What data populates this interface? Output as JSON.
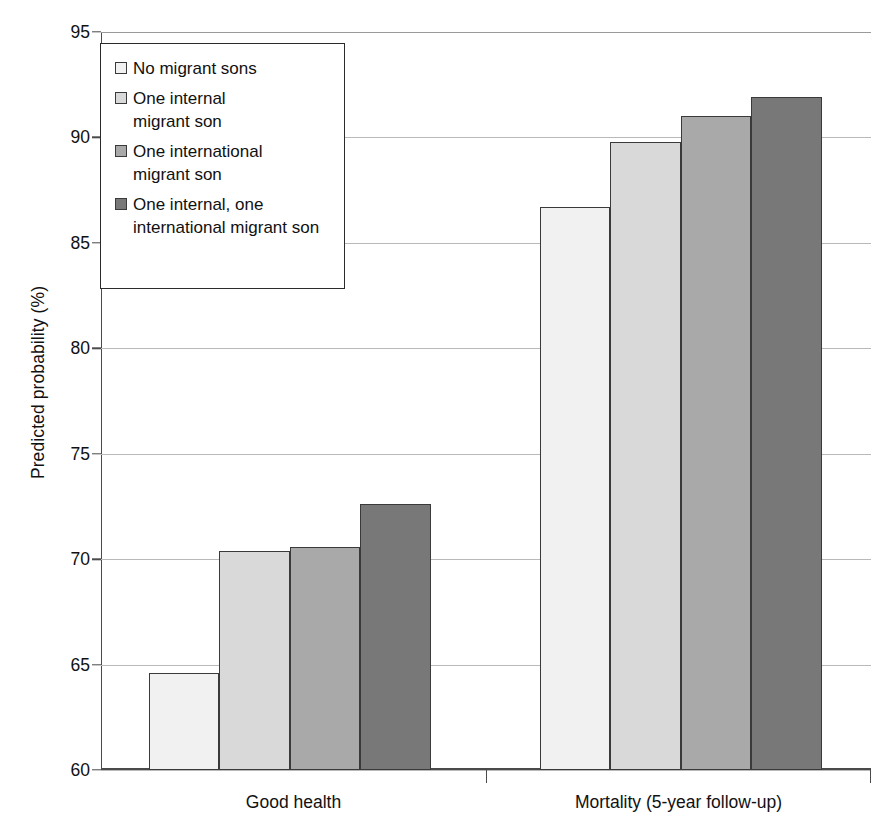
{
  "chart_data": {
    "type": "bar",
    "title": "",
    "xlabel": "",
    "ylabel": "Predicted probability (%)",
    "ylim": [
      60,
      95
    ],
    "ytick_labels": [
      "95",
      "90",
      "85",
      "80",
      "75",
      "70",
      "65",
      "60"
    ],
    "ytick_values": [
      95,
      90,
      85,
      80,
      75,
      70,
      65,
      60
    ],
    "grid": true,
    "legend_position": "upper-left-inside",
    "categories": [
      "Good health",
      "Mortality (5-year follow-up)"
    ],
    "series": [
      {
        "name": "No migrant sons",
        "color": "#f1f1f1",
        "values": [
          64.6,
          86.7
        ]
      },
      {
        "name": "One internal migrant son",
        "color": "#d9d9d9",
        "values": [
          70.4,
          89.8
        ]
      },
      {
        "name": "One international migrant son",
        "color": "#a9a9a9",
        "values": [
          70.6,
          91.0
        ]
      },
      {
        "name": "One internal, one international migrant son",
        "color": "#787878",
        "values": [
          72.6,
          91.9
        ]
      }
    ]
  },
  "legend": {
    "items": [
      {
        "label": "No migrant sons"
      },
      {
        "label": "One internal\nmigrant son"
      },
      {
        "label": "One international\nmigrant son"
      },
      {
        "label": "One internal, one\ninternational migrant son"
      }
    ]
  }
}
